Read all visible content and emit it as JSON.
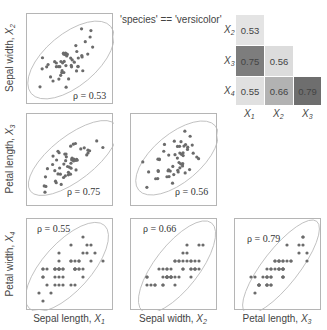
{
  "chart_data": {
    "type": "scatter",
    "title": "'species' == 'versicolor'",
    "layout": "lower-triangular pair plot with correlation heatmap",
    "variables": [
      {
        "name": "Sepal length",
        "symbol": "X",
        "index": "1"
      },
      {
        "name": "Sepal width",
        "symbol": "X",
        "index": "2"
      },
      {
        "name": "Petal length",
        "symbol": "X",
        "index": "3"
      },
      {
        "name": "Petal width",
        "symbol": "X",
        "index": "4"
      }
    ],
    "panels": [
      {
        "row": 1,
        "col": 1,
        "x": "Sepal length, X1",
        "y": "Sepal width, X2",
        "rho": "ρ = 0.53"
      },
      {
        "row": 2,
        "col": 1,
        "x": "Sepal length, X1",
        "y": "Petal length, X3",
        "rho": "ρ = 0.75"
      },
      {
        "row": 2,
        "col": 2,
        "x": "Sepal width, X2",
        "y": "Petal length, X3",
        "rho": "ρ = 0.56"
      },
      {
        "row": 3,
        "col": 1,
        "x": "Sepal length, X1",
        "y": "Petal width, X4",
        "rho": "ρ = 0.55"
      },
      {
        "row": 3,
        "col": 2,
        "x": "Sepal width, X2",
        "y": "Petal width, X4",
        "rho": "ρ = 0.66"
      },
      {
        "row": 3,
        "col": 3,
        "x": "Petal length, X3",
        "y": "Petal width, X4",
        "rho": "ρ = 0.79"
      }
    ],
    "heatmap": {
      "type": "heatmap",
      "row_labels": [
        "X2",
        "X3",
        "X4"
      ],
      "col_labels": [
        "X1",
        "X2",
        "X3"
      ],
      "values": [
        [
          0.53,
          null,
          null
        ],
        [
          0.75,
          0.56,
          null
        ],
        [
          0.55,
          0.66,
          0.79
        ]
      ]
    }
  },
  "title": "'species' == 'versicolor'",
  "labels": {
    "sepal_width": "Sepal width, ",
    "petal_length": "Petal length, ",
    "petal_width": "Petal width, ",
    "sepal_length": "Sepal length, ",
    "X": "X",
    "i1": "1",
    "i2": "2",
    "i3": "3",
    "i4": "4"
  },
  "rho": {
    "p21": "ρ = 0.53",
    "p31": "ρ = 0.75",
    "p32": "ρ = 0.56",
    "p41": "ρ = 0.55",
    "p42": "ρ = 0.66",
    "p43": "ρ = 0.79"
  },
  "heatmap": {
    "cells": {
      "c21": "0.53",
      "c31": "0.75",
      "c32": "0.56",
      "c41": "0.55",
      "c42": "0.66",
      "c43": "0.79"
    },
    "colors": {
      "c21": "#e4e4e4",
      "c31": "#7d7d7d",
      "c32": "#dcdcdc",
      "c41": "#e0e0e0",
      "c42": "#b2b2b2",
      "c43": "#6e6e6e"
    }
  },
  "colors": {
    "point": "#6b6b6b",
    "ellipse": "#b8b8b8",
    "frame": "#b5b5b5"
  }
}
